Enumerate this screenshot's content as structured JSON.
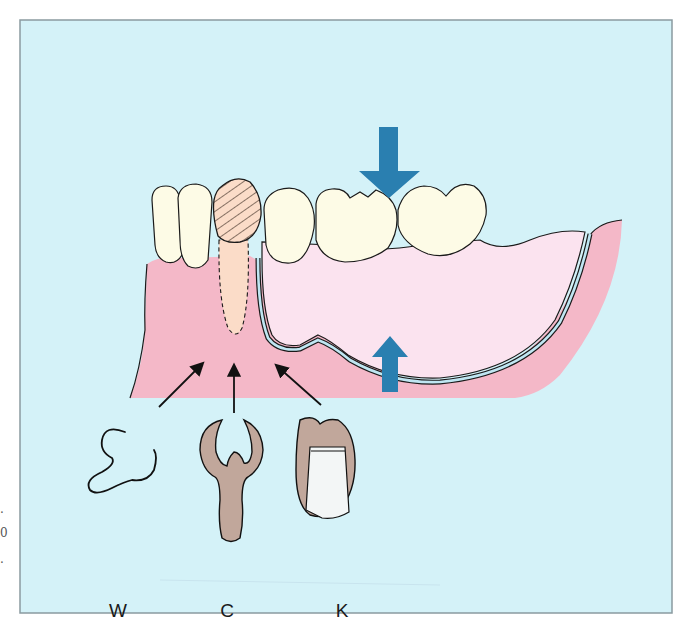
{
  "figure": {
    "background_color": "#d4f2f8",
    "frame_color": "#8a9aa0",
    "gum_color": "#f4b8c8",
    "denture_base_color": "#fbe3ef",
    "tooth_color": "#fdfbe6",
    "abutment_root_color": "#fbdcc8",
    "retainer_color": "#c1a79b",
    "arrow_color": "#2a7fb0",
    "outline_color": "#1a1a1a"
  },
  "elements": {
    "force_arrow_down": "occlusal-load-arrow",
    "force_arrow_up": "tissue-support-arrow",
    "abutment": "abutment-tooth-hatched",
    "denture": "removable-partial-denture-base"
  },
  "labels": {
    "wire_clasp": "W",
    "cast_clasp": "C",
    "crown_attachment": "K"
  },
  "edge_marks": [
    ".",
    "0",
    "."
  ]
}
